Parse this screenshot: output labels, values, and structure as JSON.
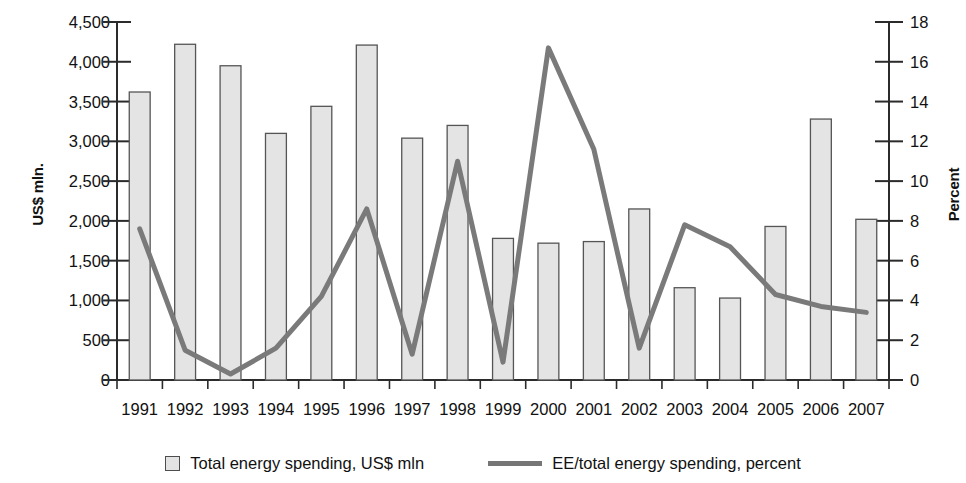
{
  "chart_data": {
    "type": "bar",
    "title": "",
    "subtitle": "",
    "xlabel": "",
    "ylabel": "US$ mln.",
    "ylabel_secondary": "Percent",
    "categories": [
      "1991",
      "1992",
      "1993",
      "1994",
      "1995",
      "1996",
      "1997",
      "1998",
      "1999",
      "2000",
      "2001",
      "2002",
      "2003",
      "2004",
      "2005",
      "2006",
      "2007"
    ],
    "ylim": [
      0,
      4500
    ],
    "ylim_secondary": [
      0,
      18
    ],
    "yticks": [
      "0",
      "500",
      "1,000",
      "1,500",
      "2,000",
      "2,500",
      "3,000",
      "3,500",
      "4,000",
      "4,500"
    ],
    "yticks_secondary": [
      "0",
      "2",
      "4",
      "6",
      "8",
      "10",
      "12",
      "14",
      "16",
      "18"
    ],
    "grid": false,
    "legend_position": "bottom",
    "series": [
      {
        "name": "Total energy spending, US$ mln",
        "type": "bar",
        "axis": "left",
        "color": "#e4e4e4",
        "values": [
          3620,
          4220,
          3950,
          3100,
          3440,
          4210,
          3040,
          3200,
          1780,
          1720,
          1740,
          2150,
          1160,
          1030,
          1930,
          3280,
          2020
        ]
      },
      {
        "name": "EE/total energy spending, percent",
        "type": "line",
        "axis": "right",
        "color": "#7a7a7a",
        "values": [
          7.6,
          1.5,
          0.3,
          1.6,
          4.2,
          8.6,
          1.3,
          11.0,
          0.9,
          16.7,
          11.6,
          1.6,
          7.8,
          6.7,
          4.3,
          3.7,
          3.4
        ]
      }
    ]
  },
  "axes": {
    "left_title": "US$ mln.",
    "right_title": "Percent"
  },
  "legend": {
    "items": [
      {
        "label": "Total energy spending, US$ mln",
        "marker": "square-swatch-icon"
      },
      {
        "label": "EE/total energy spending, percent",
        "marker": "line-swatch-icon"
      }
    ]
  }
}
